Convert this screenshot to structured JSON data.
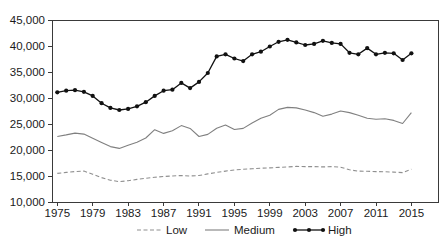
{
  "chart_data": {
    "type": "line",
    "title": "",
    "xlabel": "",
    "ylabel": "",
    "x": [
      1975,
      1976,
      1977,
      1978,
      1979,
      1980,
      1981,
      1982,
      1983,
      1984,
      1985,
      1986,
      1987,
      1988,
      1989,
      1990,
      1991,
      1992,
      1993,
      1994,
      1995,
      1996,
      1997,
      1998,
      1999,
      2000,
      2001,
      2002,
      2003,
      2004,
      2005,
      2006,
      2007,
      2008,
      2009,
      2010,
      2011,
      2012,
      2013,
      2014,
      2015
    ],
    "series": [
      {
        "name": "Low",
        "style": "dashed",
        "color": "#8f8f8f",
        "values": [
          15500,
          15700,
          15850,
          15950,
          15350,
          14700,
          14200,
          13900,
          14100,
          14350,
          14550,
          14750,
          14900,
          15000,
          15100,
          15000,
          15100,
          15400,
          15700,
          15950,
          16150,
          16300,
          16400,
          16500,
          16550,
          16650,
          16750,
          16850,
          16800,
          16800,
          16750,
          16800,
          16700,
          16200,
          15950,
          15900,
          15850,
          15800,
          15750,
          15650,
          16300
        ]
      },
      {
        "name": "Medium",
        "style": "solid",
        "color": "#808080",
        "values": [
          22600,
          22900,
          23250,
          23050,
          22250,
          21450,
          20650,
          20300,
          20900,
          21500,
          22300,
          23900,
          23200,
          23700,
          24700,
          24150,
          22600,
          23000,
          24200,
          24800,
          23950,
          24150,
          25200,
          26100,
          26700,
          27800,
          28200,
          28100,
          27700,
          27200,
          26500,
          26900,
          27500,
          27200,
          26700,
          26100,
          25900,
          26000,
          25700,
          25100,
          27200
        ]
      },
      {
        "name": "High",
        "style": "solid-markers",
        "color": "#111111",
        "values": [
          31100,
          31400,
          31500,
          31200,
          30400,
          29000,
          28100,
          27700,
          27900,
          28400,
          29200,
          30400,
          31400,
          31600,
          32900,
          31900,
          33100,
          34800,
          38000,
          38400,
          37600,
          37100,
          38400,
          38900,
          39900,
          40800,
          41200,
          40700,
          40200,
          40400,
          41000,
          40600,
          40400,
          38700,
          38400,
          39600,
          38400,
          38700,
          38600,
          37300,
          38600
        ]
      }
    ],
    "ylim": [
      10000,
      45000
    ],
    "y_ticks": [
      10000,
      15000,
      20000,
      25000,
      30000,
      35000,
      40000,
      45000
    ],
    "y_tick_labels": [
      "10,000",
      "15,000",
      "20,000",
      "25,000",
      "30,000",
      "35,000",
      "40,000",
      "45,000"
    ],
    "x_ticks": [
      1975,
      1979,
      1983,
      1987,
      1991,
      1995,
      1999,
      2003,
      2007,
      2011,
      2015
    ],
    "x_tick_labels": [
      "1975",
      "1979",
      "1983",
      "1987",
      "1991",
      "1995",
      "1999",
      "2003",
      "2007",
      "2011",
      "2015"
    ],
    "grid": false,
    "plot_border": true,
    "legend": {
      "position": "bottom-center",
      "items": [
        "Low",
        "Medium",
        "High"
      ]
    }
  },
  "colors": {
    "background": "#ffffff",
    "axis": "#3a3a3a",
    "text": "#1a1a1a",
    "series_low": "#8f8f8f",
    "series_medium": "#808080",
    "series_high": "#111111"
  }
}
